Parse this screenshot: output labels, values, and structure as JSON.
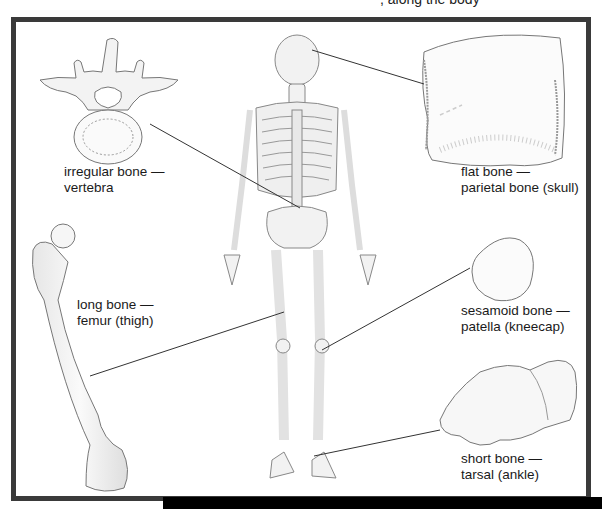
{
  "figure": {
    "cropped_caption_fragment": ", along the body",
    "colors": {
      "frame": "#3a3a3a",
      "bone_fill": "#f4f4f4",
      "bone_shade": "#d9d9d9",
      "outline": "#777777",
      "leader_line": "#333333",
      "text": "#1a1a1a"
    },
    "labels": [
      {
        "id": "irregular",
        "type": "irregular bone —",
        "example": "vertebra"
      },
      {
        "id": "flat",
        "type": "flat bone —",
        "example": "parietal bone (skull)"
      },
      {
        "id": "long",
        "type": "long bone —",
        "example": "femur (thigh)"
      },
      {
        "id": "sesamoid",
        "type": "sesamoid bone —",
        "example": "patella (kneecap)"
      },
      {
        "id": "short",
        "type": "short bone —",
        "example": "tarsal (ankle)"
      }
    ],
    "illustrations": [
      "vertebra",
      "parietal-bone",
      "skeleton",
      "femur",
      "patella",
      "tarsal"
    ]
  }
}
